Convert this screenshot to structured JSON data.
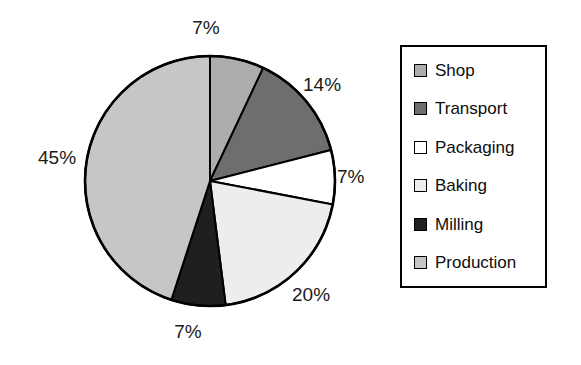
{
  "chart_data": {
    "type": "pie",
    "title": "",
    "categories": [
      "Shop",
      "Transport",
      "Packaging",
      "Baking",
      "Milling",
      "Production"
    ],
    "values": [
      7,
      14,
      7,
      20,
      7,
      45
    ],
    "value_labels": [
      "7%",
      "14%",
      "7%",
      "20%",
      "7%",
      "45%"
    ],
    "unit": "%",
    "start_angle_deg": 0,
    "direction": "clockwise",
    "legend_position": "right",
    "grid": false,
    "colors": [
      "#adadad",
      "#6e6e6e",
      "#ffffff",
      "#ededed",
      "#1f1f1f",
      "#c6c6c6"
    ],
    "outline_color": "#000000"
  },
  "pie": {
    "center_x": 210,
    "center_y": 181,
    "radius": 125,
    "slices": [
      {
        "name": "Shop",
        "value": 7,
        "label": "7%",
        "color": "#adadad",
        "label_x": 206,
        "label_y": 18,
        "anchor": "middle"
      },
      {
        "name": "Transport",
        "value": 14,
        "label": "14%",
        "color": "#6e6e6e",
        "label_x": 303,
        "label_y": 75,
        "anchor": "start"
      },
      {
        "name": "Packaging",
        "value": 7,
        "label": "7%",
        "color": "#ffffff",
        "label_x": 337,
        "label_y": 167,
        "anchor": "start"
      },
      {
        "name": "Baking",
        "value": 20,
        "label": "20%",
        "color": "#ededed",
        "label_x": 292,
        "label_y": 285,
        "anchor": "start"
      },
      {
        "name": "Milling",
        "value": 7,
        "label": "7%",
        "color": "#1f1f1f",
        "label_x": 188,
        "label_y": 322,
        "anchor": "middle"
      },
      {
        "name": "Production",
        "value": 45,
        "label": "45%",
        "color": "#c6c6c6",
        "label_x": 38,
        "label_y": 148,
        "anchor": "start"
      }
    ]
  },
  "legend": {
    "items": [
      {
        "label": "Shop",
        "color": "#adadad"
      },
      {
        "label": "Transport",
        "color": "#6e6e6e"
      },
      {
        "label": "Packaging",
        "color": "#ffffff"
      },
      {
        "label": "Baking",
        "color": "#ededed"
      },
      {
        "label": "Milling",
        "color": "#1f1f1f"
      },
      {
        "label": "Production",
        "color": "#c6c6c6"
      }
    ]
  }
}
